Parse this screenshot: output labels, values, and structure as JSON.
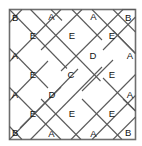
{
  "figure": {
    "frame": {
      "x": 9.5,
      "y": 9.5,
      "width": 126,
      "height": 130,
      "stroke_color": "#6e6e6e",
      "fill_color": "#ffffff"
    },
    "lattice": {
      "line_color": "#5a5a5a",
      "cell_size": 21,
      "columns": 6,
      "rows": 6
    },
    "labels": {
      "corners": [
        {
          "name": "corner-top-left",
          "text": "B",
          "x": 13,
          "y": 17
        },
        {
          "name": "corner-top-right",
          "text": "B",
          "x": 127,
          "y": 17
        },
        {
          "name": "corner-bottom-left",
          "text": "B",
          "x": 13,
          "y": 133
        },
        {
          "name": "corner-bottom-right",
          "text": "B",
          "x": 127,
          "y": 133
        }
      ],
      "edges": [
        {
          "name": "edge-top-1",
          "text": "A",
          "x": 51.5,
          "y": 17
        },
        {
          "name": "edge-top-2",
          "text": "A",
          "x": 93.5,
          "y": 17
        },
        {
          "name": "edge-bottom-1",
          "text": "A",
          "x": 51.5,
          "y": 134
        },
        {
          "name": "edge-bottom-2",
          "text": "A",
          "x": 93.5,
          "y": 134
        },
        {
          "name": "edge-left-1",
          "text": "A",
          "x": 14,
          "y": 56
        },
        {
          "name": "edge-left-2",
          "text": "A",
          "x": 14,
          "y": 95
        },
        {
          "name": "edge-right-1",
          "text": "A",
          "x": 131,
          "y": 56
        },
        {
          "name": "edge-right-2",
          "text": "A",
          "x": 131,
          "y": 95
        }
      ],
      "diamonds": [
        {
          "name": "diamond-e-1",
          "text": "E",
          "x": 33,
          "y": 36
        },
        {
          "name": "diamond-e-2",
          "text": "E",
          "x": 72,
          "y": 36
        },
        {
          "name": "diamond-e-3",
          "text": "E",
          "x": 112,
          "y": 36
        },
        {
          "name": "diamond-e-4",
          "text": "E",
          "x": 33,
          "y": 75
        },
        {
          "name": "diamond-e-5",
          "text": "E",
          "x": 112,
          "y": 75
        },
        {
          "name": "diamond-e-6",
          "text": "E",
          "x": 33,
          "y": 114
        },
        {
          "name": "diamond-e-7",
          "text": "E",
          "x": 72,
          "y": 114
        },
        {
          "name": "diamond-e-8",
          "text": "E",
          "x": 112,
          "y": 114
        },
        {
          "name": "diamond-d-1",
          "text": "D",
          "x": 93,
          "y": 56
        },
        {
          "name": "diamond-d-2",
          "text": "D",
          "x": 52,
          "y": 95
        },
        {
          "name": "diamond-c-center",
          "text": "C",
          "x": 71,
          "y": 75
        }
      ]
    }
  }
}
